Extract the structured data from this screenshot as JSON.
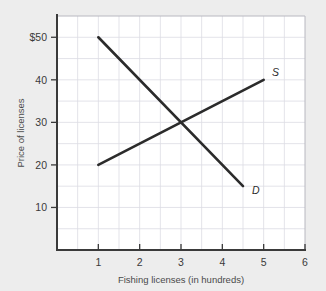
{
  "figure": {
    "background_color": "#ededed",
    "plot_background_color": "#ffffff",
    "grid_color": "#d9d9e0",
    "axis_color": "#3a3a3a",
    "curve_color": "#2b2b2b"
  },
  "chart_data": {
    "type": "line",
    "title": "",
    "xlabel": "Fishing licenses (in hundreds)",
    "ylabel": "Price of licenses",
    "xlim": [
      0,
      6
    ],
    "ylim": [
      0,
      55
    ],
    "grid": true,
    "legend": "none",
    "x_ticks": [
      1,
      2,
      3,
      4,
      5,
      6
    ],
    "x_tick_labels": [
      "1",
      "2",
      "3",
      "4",
      "5",
      "6"
    ],
    "y_ticks": [
      10,
      20,
      30,
      40,
      50
    ],
    "y_tick_labels": [
      "10",
      "20",
      "30",
      "40",
      "$50"
    ],
    "x_minor_step": 0.5,
    "y_minor_step": 5,
    "series": [
      {
        "name": "D",
        "label": "D",
        "description": "Demand curve",
        "points": [
          [
            1,
            50
          ],
          [
            4.5,
            15
          ]
        ]
      },
      {
        "name": "S",
        "label": "S",
        "description": "Supply curve",
        "points": [
          [
            1,
            20
          ],
          [
            5,
            40
          ]
        ]
      }
    ],
    "annotations": [
      {
        "name": "demand-label",
        "text": "D",
        "x": 4.72,
        "y": 13.2
      },
      {
        "name": "supply-label",
        "text": "S",
        "x": 5.2,
        "y": 41.0
      }
    ],
    "equilibrium": {
      "x": 3,
      "y": 30
    }
  }
}
